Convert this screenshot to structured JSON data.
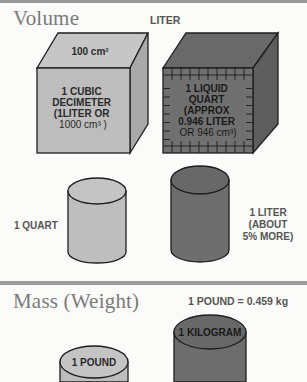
{
  "sections": {
    "volume": {
      "title": "Volume",
      "top_label": "LITER",
      "light_cube": {
        "top_face_label": "100 cm²",
        "front_lines": [
          "1 CUBIC",
          "DECIMETER",
          "(1LITER OR",
          "1000 cm³ )"
        ]
      },
      "dark_cube": {
        "front_lines": [
          "1 LIQUID",
          "QUART",
          "(APPROX",
          "0.946 LITER",
          "OR  946 cm³)"
        ]
      },
      "cylinders": {
        "left_label": "1 QUART",
        "right_label_lines": [
          "1 LITER",
          "(ABOUT",
          "5% MORE)"
        ]
      }
    },
    "mass": {
      "title": "Mass  (Weight)",
      "conversion": "1 POUND = 0.459 kg",
      "small_cylinder_label": "1 POUND",
      "large_cylinder_label": "1 KILOGRAM"
    }
  },
  "colors": {
    "light_fill": "#bdbdbd",
    "light_side": "#a9a9a9",
    "light_top": "#c6c6c6",
    "dark_fill": "#707070",
    "dark_side": "#5e5e5e",
    "dark_top": "#696969",
    "outline": "#1e1e1e",
    "light_text": "#2a2a2a",
    "dark_text": "#1a1a1a"
  }
}
